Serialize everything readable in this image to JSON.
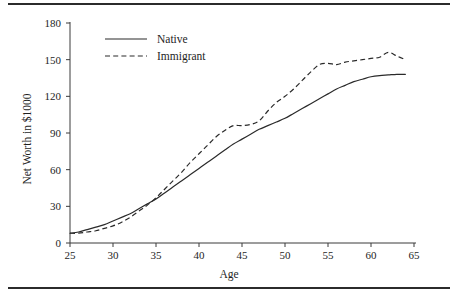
{
  "figure": {
    "top_rule": "horizontal-rule",
    "bottom_rule": "horizontal-rule"
  },
  "chart_data": {
    "type": "line",
    "title": "",
    "subtitle": "",
    "xlabel": "Age",
    "ylabel": "Net Worth in $1000",
    "xlim": [
      25,
      65
    ],
    "ylim": [
      0,
      180
    ],
    "xticks": [
      25,
      30,
      35,
      40,
      45,
      50,
      55,
      60,
      65
    ],
    "xtick_labels": [
      "25",
      "30",
      "35",
      "40",
      "45",
      "50",
      "55",
      "60",
      "65"
    ],
    "yticks": [
      0,
      30,
      60,
      90,
      120,
      150,
      180
    ],
    "ytick_labels": [
      "0",
      "30",
      "60",
      "90",
      "120",
      "150",
      "180"
    ],
    "grid": false,
    "legend_position": "upper left",
    "line_color": "#2a2a2a",
    "x": [
      25,
      26,
      27,
      28,
      29,
      30,
      31,
      32,
      33,
      34,
      35,
      36,
      37,
      38,
      39,
      40,
      41,
      42,
      43,
      44,
      45,
      46,
      47,
      48,
      49,
      50,
      51,
      52,
      53,
      54,
      55,
      56,
      57,
      58,
      59,
      60,
      61,
      62,
      63,
      64
    ],
    "series": [
      {
        "name": "Native",
        "style": "solid",
        "values": [
          8,
          9,
          11,
          13,
          15,
          18,
          21,
          24,
          28,
          32,
          36,
          41,
          46,
          51,
          56,
          61,
          66,
          71,
          76,
          81,
          85,
          89,
          93,
          96,
          99,
          102,
          106,
          110,
          114,
          118,
          122,
          126,
          129,
          132,
          134,
          136,
          137,
          137.5,
          138,
          138
        ]
      },
      {
        "name": "Immigrant",
        "style": "dashed",
        "values": [
          8,
          8,
          9,
          10,
          12,
          14,
          17,
          21,
          26,
          31,
          37,
          44,
          51,
          58,
          66,
          73,
          80,
          87,
          92,
          96,
          96,
          97,
          100,
          108,
          115,
          120,
          126,
          133,
          140,
          146,
          147,
          146,
          148,
          149,
          150,
          151,
          152,
          156,
          153,
          150
        ]
      }
    ]
  },
  "legend": {
    "items": [
      {
        "label": "Native",
        "style": "solid"
      },
      {
        "label": "Immigrant",
        "style": "dashed"
      }
    ]
  }
}
